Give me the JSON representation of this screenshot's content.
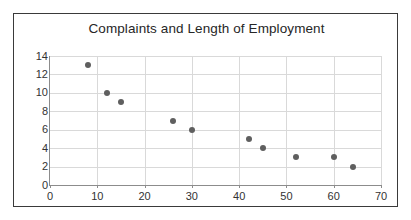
{
  "chart_data": {
    "type": "scatter",
    "title": "Complaints and Length of Employment",
    "xlabel": "",
    "ylabel": "",
    "xlim": [
      0,
      70
    ],
    "ylim": [
      0,
      14
    ],
    "xticks": [
      0,
      10,
      20,
      30,
      40,
      50,
      60,
      70
    ],
    "yticks": [
      0,
      2,
      4,
      6,
      8,
      10,
      12,
      14
    ],
    "grid": true,
    "legend": "none",
    "series": [
      {
        "name": "Complaints vs Length of Employment",
        "marker": "filled-circle",
        "color": "#5f5f5f",
        "points": [
          {
            "x": 8,
            "y": 13
          },
          {
            "x": 12,
            "y": 10
          },
          {
            "x": 15,
            "y": 9
          },
          {
            "x": 26,
            "y": 7
          },
          {
            "x": 30,
            "y": 6
          },
          {
            "x": 42,
            "y": 5
          },
          {
            "x": 45,
            "y": 4
          },
          {
            "x": 52,
            "y": 3
          },
          {
            "x": 60,
            "y": 3
          },
          {
            "x": 64,
            "y": 2
          }
        ]
      }
    ]
  },
  "style": {
    "background": "#ffffff",
    "frame_border": "#3a3a3a",
    "gridline": "#d9d9d9",
    "axis_line": "#8c8c8c",
    "title_color": "#262626",
    "tick_color": "#333333",
    "marker_color": "#5f5f5f"
  }
}
